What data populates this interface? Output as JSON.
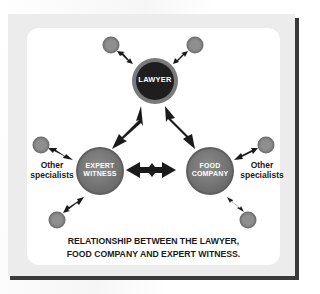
{
  "diagram": {
    "colors": {
      "frame": "#ececec",
      "frame_shadow": "#3a3a3a",
      "panel": "#ffffff",
      "lawyer_fill": "#1e1e1e",
      "lawyer_ring": "#7a7a7a",
      "node_fill": "#7b7b7b",
      "node_ring": "#5f5f5f",
      "small_node_fill": "#8a8a8a",
      "arrow": "#1a1a1a",
      "text_dark": "#1a1a1a",
      "text_light": "#ffffff"
    },
    "nodes": {
      "lawyer": {
        "label": "LAWYER"
      },
      "expert_witness": {
        "line1": "EXPERT",
        "line2": "WITNESS"
      },
      "food_company": {
        "line1": "FOOD",
        "line2": "COMPANY"
      }
    },
    "side_labels": {
      "left": {
        "line1": "Other",
        "line2": "specialists"
      },
      "right": {
        "line1": "Other",
        "line2": "specialists"
      }
    },
    "caption": {
      "line1": "RELATIONSHIP BETWEEN THE LAWYER,",
      "line2": "FOOD COMPANY AND EXPERT WITNESS."
    },
    "connections": [
      {
        "from": "lawyer",
        "to": "expert_witness",
        "type": "double-arrow"
      },
      {
        "from": "lawyer",
        "to": "food_company",
        "type": "double-arrow"
      },
      {
        "from": "expert_witness",
        "to": "food_company",
        "type": "double-arrow"
      },
      {
        "from": "lawyer",
        "to": "small-node-top-left",
        "type": "double-arrow"
      },
      {
        "from": "lawyer",
        "to": "small-node-top-right",
        "type": "double-arrow"
      },
      {
        "from": "expert_witness",
        "to": "small-node-left",
        "type": "double-arrow"
      },
      {
        "from": "expert_witness",
        "to": "small-node-bottom-left",
        "type": "double-arrow"
      },
      {
        "from": "food_company",
        "to": "small-node-right",
        "type": "double-arrow"
      },
      {
        "from": "food_company",
        "to": "small-node-bottom-right",
        "type": "double-arrow"
      }
    ]
  }
}
